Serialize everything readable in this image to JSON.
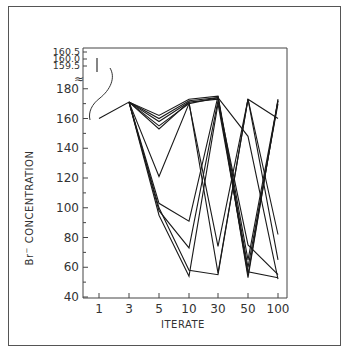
{
  "chart_data": {
    "type": "line",
    "title": "",
    "xlabel": "ITERATE",
    "ylabel": "Br⁻ CONCENTRATION",
    "x_categories": [
      "1",
      "3",
      "5",
      "10",
      "30",
      "50",
      "100"
    ],
    "y_ticks": [
      40,
      60,
      80,
      100,
      120,
      140,
      160,
      180
    ],
    "y_break_ticks": [
      "160.5",
      "160.0",
      "159.5"
    ],
    "ylim": [
      40,
      180
    ],
    "grid": false,
    "legend": "none",
    "annotations": [
      "inset scale bar near y=160.0 with curved connector to iterate 1 value"
    ],
    "series": [
      {
        "name": "path 1",
        "values": [
          160,
          171,
          162,
          173,
          175,
          53,
          173
        ]
      },
      {
        "name": "path 2",
        "values": [
          null,
          171,
          160,
          172,
          174,
          55,
          172
        ]
      },
      {
        "name": "path 3",
        "values": [
          null,
          171,
          158,
          171,
          173,
          60,
          170
        ]
      },
      {
        "name": "path 4",
        "values": [
          null,
          171,
          155,
          170,
          174,
          148,
          52
        ]
      },
      {
        "name": "path 5",
        "values": [
          null,
          171,
          153,
          171,
          56,
          173,
          65
        ]
      },
      {
        "name": "path 6",
        "values": [
          null,
          171,
          121,
          170,
          74,
          173,
          82
        ]
      },
      {
        "name": "path 7",
        "values": [
          null,
          171,
          103,
          91,
          175,
          65,
          172
        ]
      },
      {
        "name": "path 8",
        "values": [
          null,
          171,
          98,
          73,
          172,
          75,
          55
        ]
      },
      {
        "name": "path 9",
        "values": [
          null,
          171,
          95,
          54,
          170,
          57,
          53
        ]
      },
      {
        "name": "path 10",
        "values": [
          null,
          171,
          100,
          58,
          55,
          173,
          160
        ]
      }
    ]
  },
  "labels": {
    "x_axis_title": "ITERATE",
    "y_axis_title_main": "Br",
    "y_axis_title_sup": "−",
    "y_axis_title_rest": " CONCENTRATION",
    "break_symbol": "≈"
  }
}
